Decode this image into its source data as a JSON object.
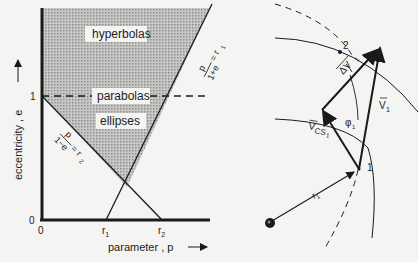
{
  "left_chart": {
    "y_axis_label": "eccentricity , e",
    "x_axis_label": "parameter , p",
    "y_tick_one": "1",
    "y_tick_zero": "0",
    "x_tick_zero": "0",
    "x_tick_r1": "r",
    "x_tick_r1_sub": "1",
    "x_tick_r2": "r",
    "x_tick_r2_sub": "2",
    "region_hyperbolas": "hyperbolas",
    "region_parabolas": "parabolas",
    "region_ellipses": "ellipses",
    "line1_label": "p/(1+e) = r",
    "line1_num": "p",
    "line1_den": "1+e",
    "line1_rhs": "= r",
    "line1_sub": "1",
    "line2_num": "p",
    "line2_den": "1−e",
    "line2_rhs": "= r",
    "line2_sub": "2"
  },
  "right_diagram": {
    "point_1": "1",
    "point_2": "2",
    "radius_label": "r",
    "radius_sub": "1",
    "v1_label": "V",
    "v1_sub": "1",
    "dv_label": "ΔV",
    "dv_sub": "1",
    "vcs_label": "V",
    "vcs_sub": "CS",
    "vcs_sub2": "1",
    "angle_label": "φ",
    "angle_sub": "1"
  },
  "colors": {
    "ink": "#1a1a1a",
    "shade": "#b8b8b6",
    "paper": "#f4f4f2"
  }
}
